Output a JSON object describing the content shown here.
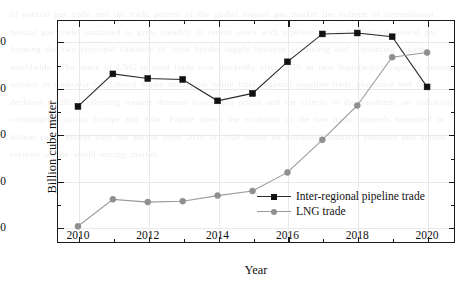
{
  "chart_data": {
    "type": "line",
    "title": "",
    "xlabel": "Year",
    "ylabel": "Billion cube meter",
    "x": [
      2010,
      2011,
      2012,
      2013,
      2014,
      2015,
      2016,
      2017,
      2018,
      2019,
      2020
    ],
    "xlim": [
      2009.4,
      2020.8
    ],
    "ylim": [
      283,
      523
    ],
    "xticks": [
      2010,
      2012,
      2014,
      2016,
      2018,
      2020
    ],
    "xticklabels": [
      "2010",
      "2012",
      "2014",
      "2016",
      "2018",
      "2020"
    ],
    "xminorticks": [
      2011,
      2013,
      2015,
      2017,
      2019
    ],
    "yticks": [
      300,
      350,
      400,
      450,
      500
    ],
    "yticklabels": [
      "300",
      "350",
      "400",
      "450",
      "500"
    ],
    "yminorticks": [
      325,
      375,
      425,
      475
    ],
    "grid": true,
    "legend_position": "center-right",
    "series": [
      {
        "name": "Inter-regional pipeline trade",
        "marker": "square",
        "color": "#111111",
        "values": [
          430,
          465,
          460,
          459,
          436,
          444,
          478,
          508,
          509,
          505,
          451
        ]
      },
      {
        "name": "LNG trade",
        "marker": "circle",
        "color": "#8f8f8f",
        "values": [
          301,
          330,
          327,
          328,
          334,
          339,
          359,
          394,
          431,
          483,
          488
        ]
      }
    ]
  },
  "legend": {
    "items": [
      {
        "label": "Inter-regional pipeline trade"
      },
      {
        "label": "LNG trade"
      }
    ]
  },
  "axes": {
    "y_title": "Billion cube meter",
    "x_title": "Year"
  },
  "background": {
    "watermark_text": "of natural gas trade and the trade pattern of the global natural gas market the volume of international natural gas trade continued to grow steadily in recent years with pipeline gas and liquefied natural gas forming the two principal channels of cross border supply between producing and consuming regions worldwide  The share of LNG in total trade rose markedly after 2016 as new liquefaction capacity entered service in Australia the United States and Qatar while inter regional pipeline trade plateaued and then declined in 2020 reflecting weaker demand lower spot prices and the effects of the pandemic on industrial consumption across Europe and Asia  Figure shows the evolution of the two trade channels measured in billion cubic metres over the period from 2010 to 2020 based on published industry statistics and annual reviews of the world energy market"
  }
}
